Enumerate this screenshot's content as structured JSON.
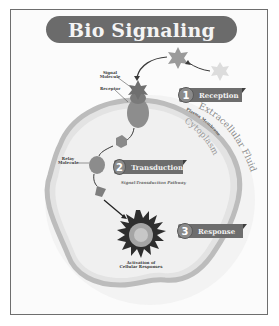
{
  "title": "Bio Signaling",
  "labels": {
    "signal_molecule": "Signal Molecule",
    "receptor": "Receptor",
    "relay_molecule": "Relay Molecule",
    "activation": "Activation of Cellular Responses",
    "pathway": "Signal-Transduction Pathway",
    "extracellular": "Extracellular Fluid",
    "plasma_membrane": "Plasma Membrane",
    "cytoplasm": "Cytoplasm"
  },
  "steps": [
    {
      "number": "1",
      "label": "Reception"
    },
    {
      "number": "2",
      "label": "Transduction"
    },
    {
      "number": "3",
      "label": "Response"
    }
  ],
  "colors": {
    "title_bg": "#6b6b6b",
    "step_bg": "#6d6d6d",
    "membrane": "#bdbdbd",
    "cell_fill": "#efefef"
  }
}
